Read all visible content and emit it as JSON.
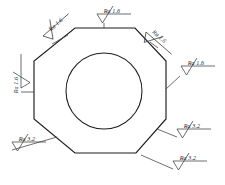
{
  "drawing": {
    "title": "Octagonal part with central bore - surface roughness callouts",
    "watermark": "· · · · · · · · · ·",
    "line_color": "#1c1c1c",
    "symbol_color": "#3d3d3d",
    "background_color": "#ffffff",
    "part": {
      "shape": "octagon",
      "name": "octagonal-flange-outline",
      "points": "75,28 135,28 166,61 166,119 136,153 75,153 34,119 34,61"
    },
    "bore": {
      "shape": "circle",
      "name": "central-bore",
      "cx": 104,
      "cy": 91,
      "r": 38
    },
    "callouts": [
      {
        "id": "callout-top-left",
        "value": "Ra 1.6",
        "text_x": 57,
        "text_y": 26,
        "rotation": -41,
        "glyph_x": 43,
        "glyph_y": 36,
        "glyph_rotation": -41,
        "leader": "M 52,44 L 68,35"
      },
      {
        "id": "callout-top-center",
        "value": "Ra 1.6",
        "text_x": 112,
        "text_y": 13,
        "rotation": 0,
        "glyph_x": 97,
        "glyph_y": 14,
        "glyph_rotation": 0,
        "leader": "M 104,23 L 104,28"
      },
      {
        "id": "callout-top-right",
        "value": "Ra 1.6",
        "text_x": 158,
        "text_y": 38,
        "rotation": 41,
        "glyph_x": 146,
        "glyph_y": 32,
        "glyph_rotation": 41,
        "leader": "M 150,42 L 158,48"
      },
      {
        "id": "callout-right",
        "value": "Ra 1.6",
        "text_x": 196,
        "text_y": 65,
        "rotation": 0,
        "glyph_x": 181,
        "glyph_y": 66,
        "glyph_rotation": 0,
        "leader": "M 180,76 L 166,89"
      },
      {
        "id": "callout-left",
        "value": "Ra 1.6",
        "text_x": 18,
        "text_y": 85,
        "rotation": -90,
        "glyph_x": 21,
        "glyph_y": 88,
        "glyph_rotation": -90,
        "leader": "M 21,92 L 34,92"
      },
      {
        "id": "callout-bottom-right-upper",
        "value": "Ra 3.2",
        "text_x": 192,
        "text_y": 128,
        "rotation": 0,
        "glyph_x": 177,
        "glyph_y": 129,
        "glyph_rotation": 0,
        "leader": "M 177,137 L 157,129"
      },
      {
        "id": "callout-bottom-right-lower",
        "value": "Ra 3.2",
        "text_x": 188,
        "text_y": 160,
        "rotation": 0,
        "glyph_x": 173,
        "glyph_y": 161,
        "glyph_rotation": 0,
        "leader": "M 173,169 L 141,155"
      },
      {
        "id": "callout-bottom-left",
        "value": "Ra 3.2",
        "text_x": 27,
        "text_y": 141,
        "rotation": 0,
        "glyph_x": 12,
        "glyph_y": 142,
        "glyph_rotation": 0,
        "leader": "M 12,150 L 57,137"
      }
    ]
  }
}
